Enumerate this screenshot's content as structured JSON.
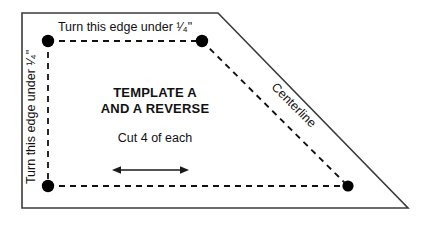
{
  "diagram": {
    "background_color": "#ffffff",
    "outline_color": "#3b3b3b",
    "dash_color": "#111111",
    "dot_color": "#000000",
    "text_color": "#111111",
    "labels": {
      "top_edge": "Turn this edge under ¹⁄₄\"",
      "left_edge": "Turn this edge under ¹⁄₄\"",
      "centerline": "Centerline",
      "template_line1": "TEMPLATE A",
      "template_line2": "AND A REVERSE",
      "cut_instruction": "Cut 4 of each"
    },
    "outline_points": "22,13 218,13 408,208 22,208",
    "dots": [
      {
        "name": "corner-dot-top-left",
        "cx": 48,
        "cy": 41,
        "r": 6
      },
      {
        "name": "corner-dot-top-right",
        "cx": 202,
        "cy": 41,
        "r": 6
      },
      {
        "name": "corner-dot-bottom-left",
        "cx": 48,
        "cy": 186,
        "r": 6
      },
      {
        "name": "corner-dot-bottom-right",
        "cx": 348,
        "cy": 186,
        "r": 5.5
      }
    ],
    "dashed_segments": [
      {
        "name": "dashed-line-top",
        "x1": 48,
        "y1": 41,
        "x2": 202,
        "y2": 41
      },
      {
        "name": "dashed-line-left",
        "x1": 48,
        "y1": 41,
        "x2": 48,
        "y2": 186
      },
      {
        "name": "dashed-line-bottom",
        "x1": 48,
        "y1": 186,
        "x2": 348,
        "y2": 186
      },
      {
        "name": "dashed-line-diagonal-centerline",
        "x1": 202,
        "y1": 41,
        "x2": 348,
        "y2": 186
      }
    ],
    "arrow": {
      "name": "grainline-double-arrow",
      "x1": 114,
      "x2": 187,
      "y": 170
    }
  }
}
